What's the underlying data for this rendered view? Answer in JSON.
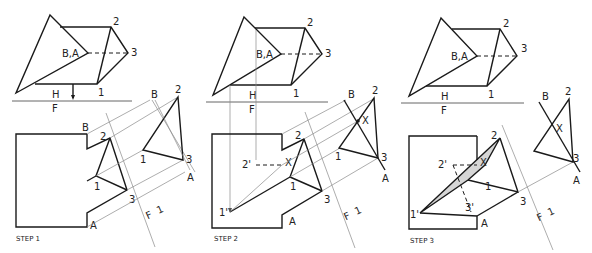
{
  "figure": {
    "colors": {
      "line": "#1a1a1a",
      "projection": "#8a8a8a",
      "shade": "#d6d6d6",
      "background": "#ffffff"
    }
  },
  "panels": [
    {
      "step_label": "STEP 1",
      "top_view": {
        "labels": {
          "edge": "B,A",
          "p2": "2",
          "p3": "3",
          "p1": "1"
        },
        "fold_h": "H",
        "fold_f": "F"
      },
      "front_view": {
        "labels": {
          "b": "B",
          "a": "A",
          "p1": "1",
          "p2": "2",
          "p3": "3"
        }
      },
      "aux_view": {
        "labels": {
          "b": "B",
          "a": "A",
          "p1": "1",
          "p2": "2",
          "p3": "3"
        },
        "fold_f": "F",
        "fold_1": "1"
      }
    },
    {
      "step_label": "STEP 2",
      "top_view": {
        "labels": {
          "edge": "B,A",
          "p2": "2",
          "p3": "3",
          "p1": "1"
        },
        "fold_h": "H",
        "fold_f": "F"
      },
      "front_view": {
        "labels": {
          "a": "A",
          "p1": "1",
          "p2": "2",
          "p3": "3",
          "p1p": "1'",
          "p2p": "2'",
          "x": "X"
        }
      },
      "aux_view": {
        "labels": {
          "b": "B",
          "a": "A",
          "p1": "1",
          "p2": "2",
          "p3": "3",
          "x": "X"
        },
        "fold_f": "F",
        "fold_1": "1"
      }
    },
    {
      "step_label": "STEP 3",
      "top_view": {
        "labels": {
          "edge": "B,A",
          "p2": "2",
          "p3": "3",
          "p1": "1"
        },
        "fold_h": "H",
        "fold_f": "F"
      },
      "front_view": {
        "labels": {
          "a": "A",
          "p1": "1",
          "p2": "2",
          "p3": "3",
          "p1p": "1'",
          "p2p": "2'",
          "p3p": "3'",
          "x": "X"
        }
      },
      "aux_view": {
        "labels": {
          "b": "B",
          "a": "A",
          "p2": "2",
          "p3": "3",
          "x": "X"
        },
        "fold_f": "F",
        "fold_1": "1"
      }
    }
  ]
}
